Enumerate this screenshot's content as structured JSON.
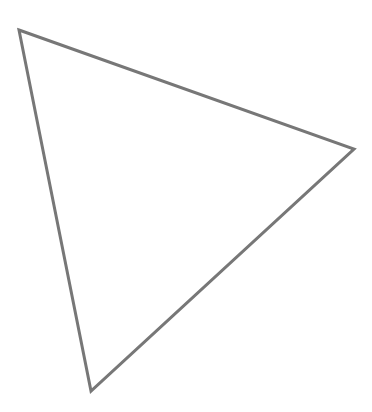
{
  "canvas": {
    "width": 372,
    "height": 412,
    "background": "#ffffff"
  },
  "shape": {
    "type": "triangle",
    "vertices": [
      {
        "x": 19,
        "y": 30
      },
      {
        "x": 354,
        "y": 149
      },
      {
        "x": 91,
        "y": 391
      }
    ],
    "stroke": "#777777",
    "stroke_width": 3,
    "fill": "none"
  }
}
